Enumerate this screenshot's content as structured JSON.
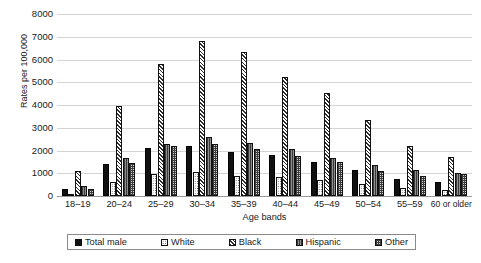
{
  "chart_data": {
    "type": "bar",
    "title": "",
    "xlabel": "Age bands",
    "ylabel": "Rates per 100,000",
    "ylim": [
      0,
      8000
    ],
    "y_ticks": [
      0,
      1000,
      2000,
      3000,
      4000,
      5000,
      6000,
      7000,
      8000
    ],
    "grid": true,
    "legend_position": "bottom",
    "categories": [
      "18–19",
      "20–24",
      "25–29",
      "30–34",
      "35–39",
      "40–44",
      "45–49",
      "50–54",
      "55–59",
      "60 or older"
    ],
    "series": [
      {
        "name": "Total male",
        "pattern": "solid-black",
        "values": [
          300,
          1400,
          2100,
          2200,
          1950,
          1800,
          1500,
          1150,
          750,
          600
        ]
      },
      {
        "name": "White",
        "pattern": "fine-dots",
        "values": [
          100,
          620,
          950,
          1050,
          900,
          850,
          700,
          550,
          350,
          250
        ]
      },
      {
        "name": "Black",
        "pattern": "diagonal-hatch",
        "values": [
          1100,
          3950,
          5800,
          6800,
          6350,
          5250,
          4550,
          3350,
          2200,
          1700
        ]
      },
      {
        "name": "Hispanic",
        "pattern": "vertical-lines",
        "values": [
          420,
          1650,
          2300,
          2600,
          2350,
          2050,
          1650,
          1350,
          1150,
          1000
        ]
      },
      {
        "name": "Other",
        "pattern": "cross-grid",
        "values": [
          330,
          1450,
          2200,
          2300,
          2050,
          1750,
          1500,
          1100,
          900,
          950
        ]
      }
    ]
  },
  "legend": {
    "items": [
      {
        "label": "Total male"
      },
      {
        "label": "White"
      },
      {
        "label": "Black"
      },
      {
        "label": "Hispanic"
      },
      {
        "label": "Other"
      }
    ]
  }
}
